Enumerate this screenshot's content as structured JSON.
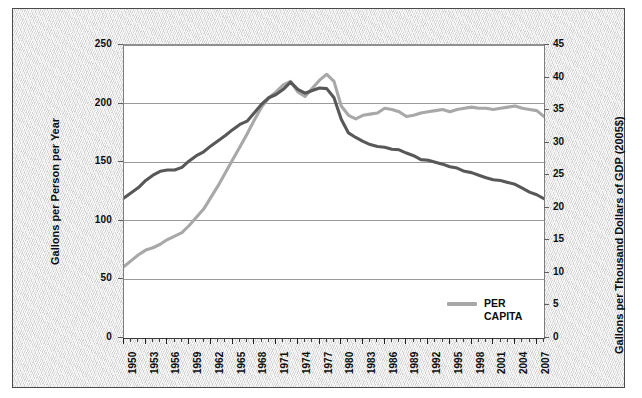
{
  "chart_data": {
    "type": "line",
    "title": "",
    "xlabel": "",
    "ylabel": "Gallons per Person per Year",
    "ylabel_right": "Gallons per Thousand Dollars of GDP (2005$)",
    "xlim": [
      1950,
      2008
    ],
    "ylim": [
      0,
      250
    ],
    "ylim_right": [
      0,
      45
    ],
    "grid": true,
    "legend_position": "bottom-right",
    "yticks": [
      0,
      50,
      100,
      150,
      200,
      250
    ],
    "yticks_right": [
      0,
      5,
      10,
      15,
      20,
      25,
      30,
      35,
      40,
      45
    ],
    "xticks": [
      1950,
      1953,
      1956,
      1959,
      1962,
      1965,
      1968,
      1971,
      1974,
      1977,
      1980,
      1983,
      1986,
      1989,
      1992,
      1995,
      1998,
      2001,
      2004,
      2007
    ],
    "x": [
      1950,
      1951,
      1952,
      1953,
      1954,
      1955,
      1956,
      1957,
      1958,
      1959,
      1960,
      1961,
      1962,
      1963,
      1964,
      1965,
      1966,
      1967,
      1968,
      1969,
      1970,
      1971,
      1972,
      1973,
      1974,
      1975,
      1976,
      1977,
      1978,
      1979,
      1980,
      1981,
      1982,
      1983,
      1984,
      1985,
      1986,
      1987,
      1988,
      1989,
      1990,
      1991,
      1992,
      1993,
      1994,
      1995,
      1996,
      1997,
      1998,
      1999,
      2000,
      2001,
      2002,
      2003,
      2004,
      2005,
      2006,
      2007,
      2008
    ],
    "series": [
      {
        "name": "PER CAPITA",
        "axis": "left",
        "color": "#a8a8a8",
        "units": "Gallons per Person per Year",
        "values": [
          61,
          66,
          71,
          75,
          77,
          80,
          84,
          87,
          90,
          96,
          103,
          110,
          120,
          130,
          141,
          152,
          163,
          174,
          186,
          197,
          205,
          210,
          216,
          219,
          210,
          206,
          213,
          220,
          225,
          219,
          198,
          190,
          187,
          190,
          191,
          192,
          196,
          195,
          193,
          189,
          190,
          192,
          193,
          194,
          195,
          193,
          195,
          196,
          197,
          196,
          196,
          195,
          196,
          197,
          198,
          196,
          195,
          194,
          189
        ]
      },
      {
        "name": "GDP INTENSITY",
        "axis": "right",
        "color": "#585858",
        "units": "Gallons per Thousand Dollars of GDP (2005$)",
        "values": [
          21.5,
          22.3,
          23.1,
          24.2,
          25.0,
          25.6,
          25.8,
          25.8,
          26.2,
          27.2,
          28.0,
          28.6,
          29.5,
          30.3,
          31.1,
          32.0,
          32.8,
          33.3,
          34.6,
          35.9,
          36.9,
          37.4,
          38.2,
          39.3,
          38.2,
          37.6,
          38.0,
          38.4,
          38.3,
          36.9,
          33.6,
          31.5,
          30.8,
          30.2,
          29.7,
          29.4,
          29.3,
          29.0,
          28.9,
          28.4,
          28.0,
          27.4,
          27.3,
          27.0,
          26.7,
          26.3,
          26.1,
          25.6,
          25.4,
          25.0,
          24.6,
          24.3,
          24.2,
          23.9,
          23.6,
          23.0,
          22.4,
          22.0,
          21.4
        ]
      }
    ],
    "legend": [
      {
        "label": "PER\nCAPITA",
        "color": "#a8a8a8"
      }
    ]
  },
  "axes": {
    "left": {
      "title": "Gallons per Person per Year",
      "ticks": [
        "0",
        "50",
        "100",
        "150",
        "200",
        "250"
      ]
    },
    "right": {
      "title": "Gallons per Thousand Dollars of GDP (2005$)",
      "ticks": [
        "0",
        "5",
        "10",
        "15",
        "20",
        "25",
        "30",
        "35",
        "40",
        "45"
      ]
    },
    "bottom": {
      "ticks": [
        "1950",
        "1953",
        "1956",
        "1959",
        "1962",
        "1965",
        "1968",
        "1971",
        "1974",
        "1977",
        "1980",
        "1983",
        "1986",
        "1989",
        "1992",
        "1995",
        "1998",
        "2001",
        "2004",
        "2007"
      ]
    }
  },
  "legend": {
    "label": "PER\nCAPITA",
    "color": "#a8a8a8"
  }
}
